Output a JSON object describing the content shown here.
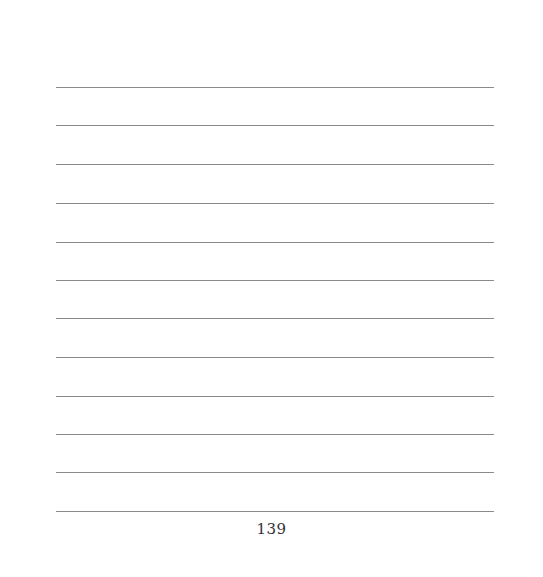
{
  "page": {
    "ruled_lines": {
      "count": 12,
      "color": "#8a8a8a",
      "positions_y": [
        87,
        125,
        164,
        203,
        242,
        280,
        318,
        357,
        396,
        434,
        472,
        511
      ]
    },
    "page_number": "139"
  }
}
